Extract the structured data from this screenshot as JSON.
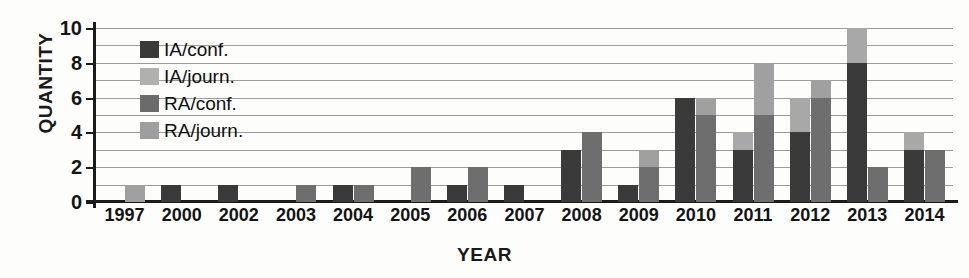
{
  "chart_data": {
    "type": "bar",
    "title": "",
    "xlabel": "YEAR",
    "ylabel": "QUANTITY",
    "ylim": [
      0,
      10
    ],
    "ytick_labels": [
      "0",
      "2",
      "4",
      "6",
      "8",
      "10"
    ],
    "ytick_values": [
      0,
      2,
      4,
      6,
      8,
      10
    ],
    "gridlines": [
      1,
      2,
      3,
      4,
      5,
      6,
      7,
      8,
      9,
      10
    ],
    "grid": true,
    "legend_position": "inside-top-left",
    "categories": [
      "1997",
      "2000",
      "2002",
      "2003",
      "2004",
      "2005",
      "2006",
      "2007",
      "2008",
      "2009",
      "2010",
      "2011",
      "2012",
      "2013",
      "2014"
    ],
    "series": [
      {
        "name": "IA/conf.",
        "color": "#3a3a3a",
        "values": [
          0,
          1,
          1,
          0,
          1,
          0,
          1,
          1,
          3,
          1,
          6,
          3,
          4,
          8,
          3
        ]
      },
      {
        "name": "IA/journ.",
        "color": "#a8a8a8",
        "values": [
          0,
          0,
          0,
          0,
          0,
          0,
          0,
          0,
          0,
          0,
          0,
          1,
          2,
          2,
          1
        ]
      },
      {
        "name": "RA/conf.",
        "color": "#6e6e6e",
        "values": [
          0,
          0,
          0,
          1,
          1,
          2,
          2,
          0,
          4,
          2,
          5,
          5,
          6,
          2,
          3
        ]
      },
      {
        "name": "RA/journ.",
        "color": "#a0a0a0",
        "values": [
          1,
          0,
          0,
          0,
          0,
          0,
          0,
          0,
          0,
          1,
          1,
          3,
          1,
          0,
          0
        ]
      }
    ]
  },
  "legend": {
    "items": [
      {
        "label": "IA/conf.",
        "color": "#3a3a3a"
      },
      {
        "label": "IA/journ.",
        "color": "#b0b0b0"
      },
      {
        "label": "RA/conf.",
        "color": "#6b6b6b"
      },
      {
        "label": "RA/journ.",
        "color": "#9e9e9e"
      }
    ]
  }
}
